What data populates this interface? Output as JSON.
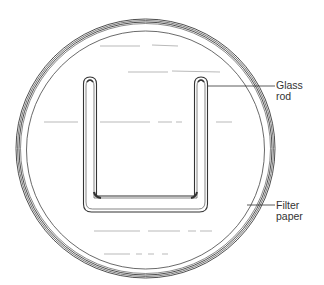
{
  "diagram": {
    "type": "labeled-illustration",
    "labels": [
      {
        "id": "glass-rod",
        "line1": "Glass",
        "line2": "rod"
      },
      {
        "id": "filter-paper",
        "line1": "Filter",
        "line2": "paper"
      }
    ],
    "colors": {
      "stroke": "#333333",
      "background": "#ffffff"
    }
  }
}
